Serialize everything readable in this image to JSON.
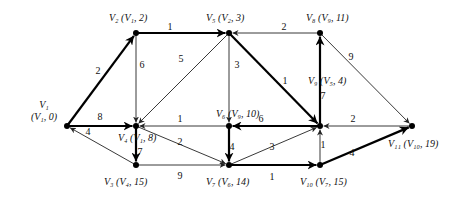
{
  "diagram": {
    "type": "shortest-path-network",
    "colors": {
      "line": "#222222",
      "bold": "#000000",
      "background": "#ffffff"
    },
    "nodes": [
      {
        "id": "V1",
        "x": 67,
        "y": 126,
        "label": "V₁",
        "tag": "(V₁, 0)",
        "lx": 44,
        "ly": 108,
        "tx": 44,
        "ty": 120,
        "anchor": "middle",
        "split": true
      },
      {
        "id": "V2",
        "x": 136,
        "y": 33,
        "label": "V₂",
        "tag": "(V₁, 2)",
        "lx": 109,
        "ly": 21
      },
      {
        "id": "V3",
        "x": 136,
        "y": 165,
        "label": "V₃",
        "tag": "(V₄, 15)",
        "lx": 104,
        "ly": 185
      },
      {
        "id": "V4",
        "x": 136,
        "y": 126,
        "label": "V₄",
        "tag": "(V₁, 8)",
        "lx": 118,
        "ly": 141
      },
      {
        "id": "V5",
        "x": 229,
        "y": 33,
        "label": "V₅",
        "tag": "(V₂, 3)",
        "lx": 206,
        "ly": 21
      },
      {
        "id": "V6",
        "x": 229,
        "y": 126,
        "label": "V₆",
        "tag": "(V₉, 10)",
        "lx": 216,
        "ly": 117
      },
      {
        "id": "V7",
        "x": 229,
        "y": 165,
        "label": "V₇",
        "tag": "(V₆, 14)",
        "lx": 206,
        "ly": 185
      },
      {
        "id": "V8",
        "x": 320,
        "y": 33,
        "label": "V₈",
        "tag": "(V₉, 11)",
        "lx": 306,
        "ly": 21
      },
      {
        "id": "V9",
        "x": 320,
        "y": 126,
        "label": "V₉",
        "tag": "(V₅, 4)",
        "lx": 308,
        "ly": 84
      },
      {
        "id": "V10",
        "x": 320,
        "y": 165,
        "label": "V₁₀",
        "tag": "(V₇, 15)",
        "lx": 300,
        "ly": 185
      },
      {
        "id": "V11",
        "x": 412,
        "y": 126,
        "label": "V₁₁",
        "tag": "(V₁₀, 19)",
        "lx": 388,
        "ly": 147
      }
    ],
    "edges": [
      {
        "from": "V1",
        "to": "V2",
        "weight": "2",
        "bold": true,
        "wx": 98,
        "wy": 74
      },
      {
        "from": "V1",
        "to": "V4",
        "weight": "8",
        "bold": true,
        "wx": 100,
        "wy": 120
      },
      {
        "from": "V3",
        "to": "V1",
        "weight": "4",
        "bold": false,
        "wx": 88,
        "wy": 135
      },
      {
        "from": "V2",
        "to": "V5",
        "weight": "1",
        "bold": true,
        "wx": 170,
        "wy": 30
      },
      {
        "from": "V2",
        "to": "V4",
        "weight": "6",
        "bold": false,
        "wx": 142,
        "wy": 68
      },
      {
        "from": "V5",
        "to": "V4",
        "weight": "5",
        "bold": false,
        "wx": 181,
        "wy": 62
      },
      {
        "from": "V6",
        "to": "V4",
        "weight": "1",
        "bold": false,
        "wx": 180,
        "wy": 122
      },
      {
        "from": "V4",
        "to": "V3",
        "weight": "7",
        "bold": true,
        "wx": 140,
        "wy": 155
      },
      {
        "from": "V4",
        "to": "V7",
        "weight": "2",
        "bold": false,
        "wx": 180,
        "wy": 145
      },
      {
        "from": "V5",
        "to": "V6",
        "weight": "3",
        "bold": false,
        "wx": 237,
        "wy": 68
      },
      {
        "from": "V8",
        "to": "V5",
        "weight": "2",
        "bold": false,
        "wx": 284,
        "wy": 30
      },
      {
        "from": "V5",
        "to": "V9",
        "weight": "1",
        "bold": true,
        "wx": 285,
        "wy": 84
      },
      {
        "from": "V9",
        "to": "V6",
        "weight": "6",
        "bold": true,
        "wx": 261,
        "wy": 122
      },
      {
        "from": "V6",
        "to": "V7",
        "weight": "4",
        "bold": true,
        "wx": 232,
        "wy": 150
      },
      {
        "from": "V3",
        "to": "V7",
        "weight": "9",
        "bold": false,
        "wx": 180,
        "wy": 179
      },
      {
        "from": "V7",
        "to": "V9",
        "weight": "3",
        "bold": false,
        "wx": 272,
        "wy": 150
      },
      {
        "from": "V7",
        "to": "V10",
        "weight": "1",
        "bold": true,
        "wx": 272,
        "wy": 180
      },
      {
        "from": "V9",
        "to": "V8",
        "weight": "7",
        "bold": true,
        "wx": 323,
        "wy": 99
      },
      {
        "from": "V8",
        "to": "V11",
        "weight": "9",
        "bold": false,
        "wx": 351,
        "wy": 60
      },
      {
        "from": "V11",
        "to": "V9",
        "weight": "2",
        "bold": false,
        "wx": 353,
        "wy": 122
      },
      {
        "from": "V10",
        "to": "V9",
        "weight": "1",
        "bold": false,
        "wx": 323,
        "wy": 148
      },
      {
        "from": "V10",
        "to": "V11",
        "weight": "4",
        "bold": true,
        "wx": 352,
        "wy": 156
      }
    ]
  }
}
